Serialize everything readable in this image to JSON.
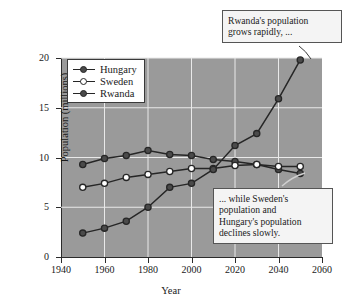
{
  "chart_data": {
    "type": "line",
    "title": "",
    "xlabel": "Year",
    "ylabel": "Population (millions)",
    "xlim": [
      1940,
      2060
    ],
    "ylim": [
      0,
      20
    ],
    "xticks": [
      1940,
      1960,
      1980,
      2000,
      2020,
      2040,
      2060
    ],
    "yticks": [
      0,
      5,
      10,
      15,
      20
    ],
    "grid": true,
    "legend_position": "top-left",
    "x": [
      1950,
      1960,
      1970,
      1980,
      1990,
      2000,
      2010,
      2020,
      2030,
      2040,
      2050
    ],
    "series": [
      {
        "name": "Hungary",
        "marker": "filled-circle",
        "values": [
          9.3,
          9.9,
          10.2,
          10.7,
          10.3,
          10.2,
          9.8,
          9.6,
          9.3,
          8.8,
          8.4
        ]
      },
      {
        "name": "Sweden",
        "marker": "open-circle",
        "values": [
          7.0,
          7.4,
          8.0,
          8.3,
          8.6,
          8.9,
          8.9,
          9.2,
          9.3,
          9.1,
          9.1
        ]
      },
      {
        "name": "Rwanda",
        "marker": "filled-circle",
        "values": [
          2.4,
          2.9,
          3.6,
          5.0,
          7.0,
          7.4,
          8.8,
          11.2,
          12.4,
          15.9,
          19.8
        ]
      }
    ],
    "annotations": [
      {
        "name": "rwanda-growth-callout",
        "text": "Rwanda's population grows rapidly, ...",
        "lines": [
          "Rwanda's population",
          "grows rapidly, ..."
        ],
        "points_to": {
          "series": "Rwanda",
          "x": 2050,
          "y": 19.8
        }
      },
      {
        "name": "decline-callout",
        "text": "... while Sweden's population and Hungary's population declines slowly.",
        "lines": [
          "... while Sweden's",
          "population and",
          "Hungary's population",
          "declines slowly."
        ],
        "points_to": {
          "series": "Hungary",
          "x": 2050,
          "y": 8.4
        }
      }
    ]
  },
  "axes": {
    "y_tick_labels": [
      "0",
      "5",
      "10",
      "15",
      "20"
    ],
    "x_tick_labels": [
      "1940",
      "1960",
      "1980",
      "2000",
      "2020",
      "2040",
      "2060"
    ],
    "y_axis_title": "Population (millions)",
    "x_axis_title": "Year"
  },
  "legend": {
    "items": [
      {
        "label": "Hungary"
      },
      {
        "label": "Sweden"
      },
      {
        "label": "Rwanda"
      }
    ]
  },
  "colors": {
    "plot_background": "#9a9a9a",
    "gridline": "#e9e9e9",
    "line": "#262626",
    "marker_fill": "#4a4a4a",
    "marker_open": "#ffffff",
    "callout_background": "#f4f4f4",
    "callout_border": "#555555",
    "page_background": "#ffffff"
  }
}
